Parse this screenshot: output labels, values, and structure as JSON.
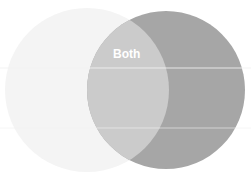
{
  "diagram": {
    "type": "venn",
    "sets": [
      {
        "name": "left-set",
        "label": "",
        "color": "#f4f4f4"
      },
      {
        "name": "right-set",
        "label": "",
        "color": "#a6a6a6"
      }
    ],
    "intersection": {
      "label": "Both",
      "color": "#cbcbcb"
    },
    "colors": {
      "background": "#ffffff",
      "divider": "#f0f0f0"
    }
  }
}
